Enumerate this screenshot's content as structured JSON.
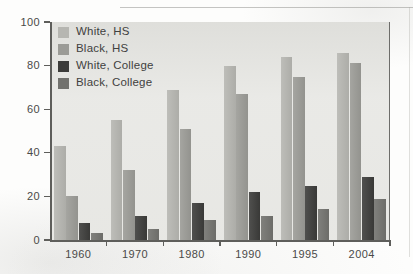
{
  "chart_data": {
    "type": "bar",
    "title": "",
    "xlabel": "",
    "ylabel": "",
    "categories": [
      "1960",
      "1970",
      "1980",
      "1990",
      "1995",
      "2004"
    ],
    "ylim": [
      0,
      100
    ],
    "yticks": [
      0,
      20,
      40,
      60,
      80,
      100
    ],
    "grid": false,
    "legend_position": "inside-top-left",
    "series": [
      {
        "name": "White, HS",
        "color": "#b6b6b1",
        "values": [
          43,
          55,
          69,
          80,
          84,
          86
        ]
      },
      {
        "name": "Black, HS",
        "color": "#9b9b96",
        "values": [
          20,
          32,
          51,
          67,
          75,
          81
        ]
      },
      {
        "name": "White, College",
        "color": "#3c3c3a",
        "values": [
          8,
          11,
          17,
          22,
          25,
          29
        ]
      },
      {
        "name": "Black, College",
        "color": "#72726e",
        "values": [
          3,
          5,
          9,
          11,
          14,
          19
        ]
      }
    ]
  },
  "axes": {
    "y_tick_labels": [
      "0",
      "20",
      "40",
      "60",
      "80",
      "100"
    ],
    "x_tick_labels": [
      "1960",
      "1970",
      "1980",
      "1990",
      "1995",
      "2004"
    ]
  },
  "legend": {
    "items": [
      {
        "label": "White, HS"
      },
      {
        "label": "Black, HS"
      },
      {
        "label": "White, College"
      },
      {
        "label": "Black, College"
      }
    ]
  },
  "colors": {
    "plot_background": "#e9e9e6",
    "axis": "#5e5e5b",
    "text": "#4a4a48",
    "series_white_hs": "#b6b6b1",
    "series_black_hs": "#9b9b96",
    "series_white_college": "#3c3c3a",
    "series_black_college": "#72726e"
  }
}
